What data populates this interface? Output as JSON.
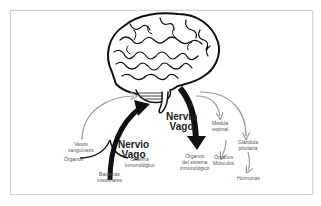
{
  "diagram": {
    "title_left": "Nervio\nVago",
    "title_right": "Nervio\nVago",
    "afferent_labels": {
      "vasos": "Vasos\nsanguíneos",
      "organos": "Órganos",
      "sistema": "Sistema\ninmunológico",
      "bacterias": "Bacterias\nintestinales"
    },
    "efferent_labels": {
      "organos_inmune": "Órganos\ndel sistema\ninmunológico",
      "medula": "Médula\nespinal",
      "organos_musculos": "Órganos\nMúsculos",
      "glandula": "Glándula\npituitaria",
      "hormonas": "Hormonas"
    },
    "colors": {
      "brain_outline": "#111111",
      "thick_arrow": "#111111",
      "thin_arrow": "#9a9a9a",
      "frame_border": "#d4d4d4"
    }
  }
}
